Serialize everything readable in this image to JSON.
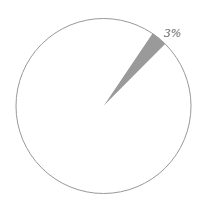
{
  "chart_data": {
    "type": "pie",
    "title": "",
    "categories": [
      "Highlighted",
      "Other"
    ],
    "values": [
      3,
      97
    ],
    "labels": [
      "3%",
      ""
    ],
    "colors": [
      "#9a9a9a",
      "#ffffff"
    ],
    "start_angle_deg": 34,
    "outline_color": "#999999",
    "legend": "none"
  },
  "geometry": {
    "cx": 103.5,
    "cy": 106,
    "r": 87.5
  }
}
